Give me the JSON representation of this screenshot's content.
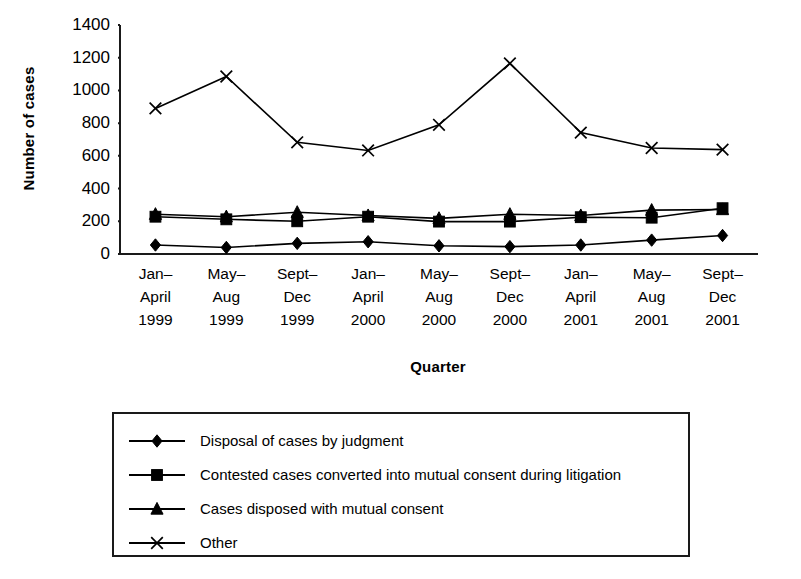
{
  "chart_data": {
    "type": "line",
    "title": "",
    "xlabel": "Quarter",
    "ylabel": "Number of cases",
    "ylim": [
      0,
      1400
    ],
    "ytick_values": [
      0,
      200,
      400,
      600,
      800,
      1000,
      1200,
      1400
    ],
    "ytick_labels": [
      "0",
      "200",
      "400",
      "600",
      "800",
      "1000",
      "1200",
      "1400"
    ],
    "grid": false,
    "legend_position": "below-plot",
    "categories": [
      "Jan– April 1999",
      "May– Aug 1999",
      "Sept– Dec 1999",
      "Jan– April 2000",
      "May– Aug 2000",
      "Sept– Dec 2000",
      "Jan– April 2001",
      "May– Aug 2001",
      "Sept– Dec 2001"
    ],
    "category_lines": [
      [
        "Jan–",
        "April",
        "1999"
      ],
      [
        "May–",
        "Aug",
        "1999"
      ],
      [
        "Sept–",
        "Dec",
        "1999"
      ],
      [
        "Jan–",
        "April",
        "2000"
      ],
      [
        "May–",
        "Aug",
        "2000"
      ],
      [
        "Sept–",
        "Dec",
        "2000"
      ],
      [
        "Jan–",
        "April",
        "2001"
      ],
      [
        "May–",
        "Aug",
        "2001"
      ],
      [
        "Sept–",
        "Dec",
        "2001"
      ]
    ],
    "series": [
      {
        "name": "Disposal of cases by judgment",
        "marker": "diamond",
        "color": "#000000",
        "values": [
          55,
          40,
          65,
          75,
          50,
          45,
          55,
          85,
          113
        ]
      },
      {
        "name": "Contested cases converted into mutual consent during litigation",
        "marker": "square",
        "color": "#000000",
        "values": [
          228,
          212,
          200,
          228,
          198,
          198,
          225,
          222,
          280
        ]
      },
      {
        "name": "Cases disposed with mutual consent",
        "marker": "triangle",
        "color": "#000000",
        "values": [
          243,
          228,
          255,
          235,
          218,
          243,
          235,
          268,
          272
        ]
      },
      {
        "name": "Other",
        "marker": "cross",
        "color": "#000000",
        "values": [
          890,
          1085,
          683,
          633,
          790,
          1165,
          742,
          648,
          638
        ]
      }
    ]
  },
  "legend": {
    "entries": [
      {
        "marker": "diamond",
        "label": "Disposal of cases by judgment"
      },
      {
        "marker": "square",
        "label": "Contested cases converted into mutual consent during litigation"
      },
      {
        "marker": "triangle",
        "label": "Cases disposed with mutual consent"
      },
      {
        "marker": "cross",
        "label": "Other"
      }
    ]
  },
  "colors": {
    "ink": "#000000",
    "axis": "#1a1a1a",
    "background": "#ffffff"
  }
}
